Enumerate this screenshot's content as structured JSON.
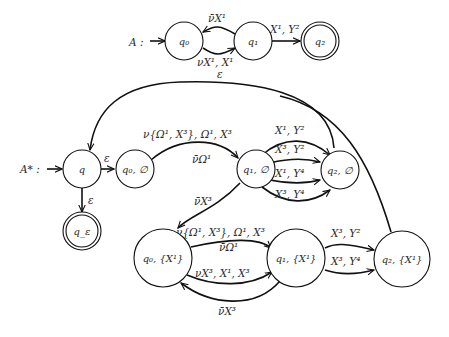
{
  "automaton_A": {
    "name": "A :",
    "states": [
      {
        "id": "q0",
        "label": "q₀"
      },
      {
        "id": "q1",
        "label": "q₁"
      },
      {
        "id": "q2",
        "label": "q₂",
        "accepting": true
      }
    ],
    "edges": [
      {
        "from": "q1",
        "to": "q0",
        "label": "ν̄X¹"
      },
      {
        "from": "q0",
        "to": "q1",
        "label": "νX¹, X¹"
      },
      {
        "from": "q1",
        "to": "q2",
        "label": "X¹, Y²"
      }
    ]
  },
  "automaton_Astar": {
    "name": "A* :",
    "states": [
      {
        "id": "q",
        "label": "q"
      },
      {
        "id": "qe",
        "label": "q_ε",
        "accepting": true
      },
      {
        "id": "q0e",
        "label": "q₀, ∅"
      },
      {
        "id": "q1e",
        "label": "q₁, ∅"
      },
      {
        "id": "q2e",
        "label": "q₂, ∅"
      },
      {
        "id": "q0x",
        "label": "q₀, {X¹}"
      },
      {
        "id": "q1x",
        "label": "q₁, {X¹}"
      },
      {
        "id": "q2x",
        "label": "q₂, {X¹}"
      }
    ],
    "edges": [
      {
        "from": "q",
        "to": "q0e",
        "label": "ε"
      },
      {
        "from": "q",
        "to": "qe",
        "label": "ε"
      },
      {
        "from": "q2e",
        "to": "q",
        "label": "ε"
      },
      {
        "from": "q2x",
        "to": "q",
        "label": ""
      },
      {
        "from": "q0e",
        "to": "q1e",
        "label_top": "ν{Ω¹, X³}, Ω¹, X³",
        "label_bottom": "ν̄Ω¹"
      },
      {
        "from": "q1e",
        "to": "q2e",
        "label": "X¹, Y²"
      },
      {
        "from": "q1e",
        "to": "q2e",
        "label": "X³, Y²"
      },
      {
        "from": "q1e",
        "to": "q2e",
        "label": "X¹, Y⁴"
      },
      {
        "from": "q1e",
        "to": "q2e",
        "label": "X³, Y⁴"
      },
      {
        "from": "q1e",
        "to": "q0x",
        "label": "ν̄X³"
      },
      {
        "from": "q0x",
        "to": "q1x",
        "label_top": "ν{Ω¹, X³}, Ω¹, X³",
        "label_bottom": "ν̄Ω¹"
      },
      {
        "from": "q0x",
        "to": "q1x",
        "label": "νX³, X¹, X³"
      },
      {
        "from": "q1x",
        "to": "q0x",
        "label": "ν̄X³"
      },
      {
        "from": "q1x",
        "to": "q2x",
        "label": "X³, Y²"
      },
      {
        "from": "q1x",
        "to": "q2x",
        "label": "X³, Y⁴"
      }
    ]
  }
}
